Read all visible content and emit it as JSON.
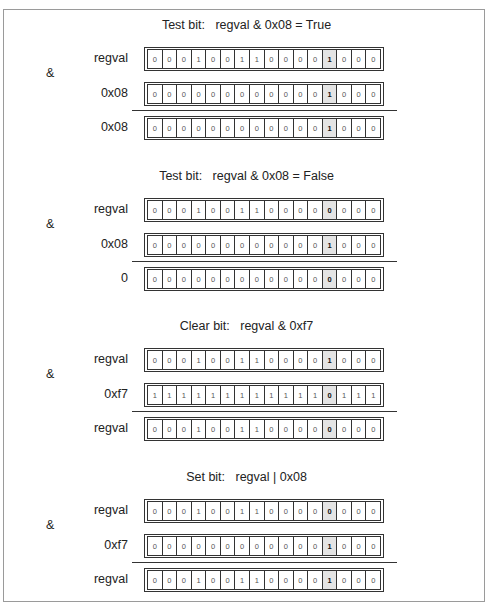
{
  "highlight_index": 12,
  "sections": [
    {
      "title": "Test bit:   regval & 0x08 = True",
      "operator": "&",
      "rows": [
        {
          "label": "regval",
          "bits": [
            "0",
            "0",
            "0",
            "1",
            "0",
            "0",
            "1",
            "1",
            "0",
            "0",
            "0",
            "0",
            "1",
            "0",
            "0",
            "0"
          ]
        },
        {
          "label": "0x08",
          "bits": [
            "0",
            "0",
            "0",
            "0",
            "0",
            "0",
            "0",
            "0",
            "0",
            "0",
            "0",
            "0",
            "1",
            "0",
            "0",
            "0"
          ]
        },
        {
          "label": "0x08",
          "bits": [
            "0",
            "0",
            "0",
            "0",
            "0",
            "0",
            "0",
            "0",
            "0",
            "0",
            "0",
            "0",
            "1",
            "0",
            "0",
            "0"
          ]
        }
      ]
    },
    {
      "title": "Test bit:   regval & 0x08 = False",
      "operator": "&",
      "rows": [
        {
          "label": "regval",
          "bits": [
            "0",
            "0",
            "0",
            "1",
            "0",
            "0",
            "1",
            "1",
            "0",
            "0",
            "0",
            "0",
            "0",
            "0",
            "0",
            "0"
          ]
        },
        {
          "label": "0x08",
          "bits": [
            "0",
            "0",
            "0",
            "0",
            "0",
            "0",
            "0",
            "0",
            "0",
            "0",
            "0",
            "0",
            "1",
            "0",
            "0",
            "0"
          ]
        },
        {
          "label": "0",
          "bits": [
            "0",
            "0",
            "0",
            "0",
            "0",
            "0",
            "0",
            "0",
            "0",
            "0",
            "0",
            "0",
            "0",
            "0",
            "0",
            "0"
          ]
        }
      ]
    },
    {
      "title": "Clear bit:   regval & 0xf7",
      "operator": "&",
      "rows": [
        {
          "label": "regval",
          "bits": [
            "0",
            "0",
            "0",
            "1",
            "0",
            "0",
            "1",
            "1",
            "0",
            "0",
            "0",
            "0",
            "1",
            "0",
            "0",
            "0"
          ]
        },
        {
          "label": "0xf7",
          "bits": [
            "1",
            "1",
            "1",
            "1",
            "1",
            "1",
            "1",
            "1",
            "1",
            "1",
            "1",
            "1",
            "0",
            "1",
            "1",
            "1"
          ]
        },
        {
          "label": "regval",
          "bits": [
            "0",
            "0",
            "0",
            "1",
            "0",
            "0",
            "1",
            "1",
            "0",
            "0",
            "0",
            "0",
            "0",
            "0",
            "0",
            "0"
          ]
        }
      ]
    },
    {
      "title": "Set bit:   regval | 0x08",
      "operator": "&",
      "rows": [
        {
          "label": "regval",
          "bits": [
            "0",
            "0",
            "0",
            "1",
            "0",
            "0",
            "1",
            "1",
            "0",
            "0",
            "0",
            "0",
            "0",
            "0",
            "0",
            "0"
          ]
        },
        {
          "label": "0xf7",
          "bits": [
            "0",
            "0",
            "0",
            "0",
            "0",
            "0",
            "0",
            "0",
            "0",
            "0",
            "0",
            "0",
            "1",
            "0",
            "0",
            "0"
          ]
        },
        {
          "label": "regval",
          "bits": [
            "0",
            "0",
            "0",
            "1",
            "0",
            "0",
            "1",
            "1",
            "0",
            "0",
            "0",
            "0",
            "1",
            "0",
            "0",
            "0"
          ]
        }
      ]
    }
  ]
}
